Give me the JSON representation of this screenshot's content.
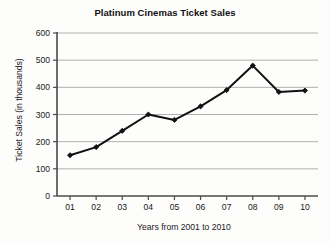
{
  "chart_data": {
    "type": "line",
    "title": "Platinum Cinemas Ticket Sales",
    "xlabel": "Years from 2001 to 2010",
    "ylabel": "Ticket Sales (in thousands)",
    "categories": [
      "01",
      "02",
      "03",
      "04",
      "05",
      "06",
      "07",
      "08",
      "09",
      "10"
    ],
    "values": [
      150,
      180,
      240,
      300,
      280,
      330,
      390,
      480,
      383,
      388
    ],
    "ylim": [
      0,
      600
    ],
    "ytick_labels": [
      "0",
      "100",
      "200",
      "300",
      "400",
      "500",
      "600"
    ],
    "ytick_values": [
      0,
      100,
      200,
      300,
      400,
      500,
      600
    ],
    "xtick_labels": [
      "01",
      "02",
      "03",
      "04",
      "05",
      "06",
      "07",
      "08",
      "09",
      "10"
    ],
    "grid": "horizontal",
    "legend": "none",
    "series_name": "Ticket Sales",
    "marker": "diamond",
    "colors": {
      "line": "#111111",
      "marker": "#111111",
      "gridline": "#b0b0b0",
      "axis": "#4a4a4a",
      "text": "#1a1a1a",
      "background": "#fdfdfc"
    }
  }
}
